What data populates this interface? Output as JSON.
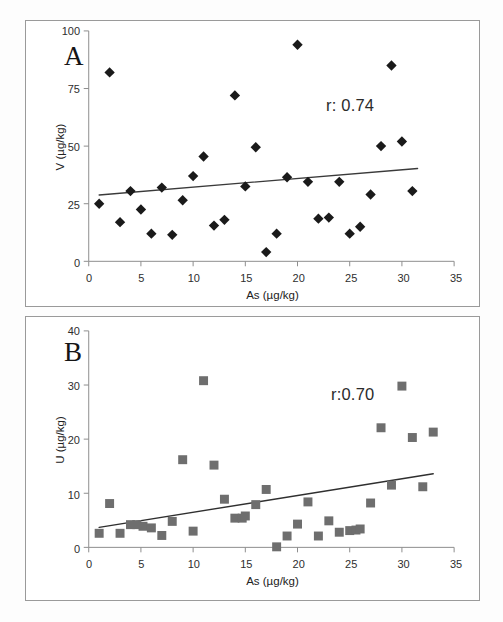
{
  "figure": {
    "caption": "",
    "background": "#fdfdfd",
    "panel_border_color": "#9a9a9a"
  },
  "chart_data": [
    {
      "type": "scatter",
      "panel": "A",
      "panel_label": "A",
      "title": "",
      "xlabel": "As (µg/kg)",
      "ylabel": "V (µg/kg)",
      "xlim": [
        0,
        35
      ],
      "ylim": [
        0,
        100
      ],
      "xticks": [
        0,
        5,
        10,
        15,
        20,
        25,
        30,
        35
      ],
      "yticks": [
        0,
        25,
        50,
        75,
        100
      ],
      "grid": false,
      "legend": "none",
      "annotation": "r: 0.74",
      "correlation_r": 0.74,
      "marker": "diamond",
      "marker_color": "#1a1a1a",
      "marker_size": 9,
      "trendline": {
        "color": "#3a3a3a",
        "width": 1.4,
        "x_start": 1.0,
        "y_start": 28.8,
        "x_end": 31.5,
        "y_end": 40.3
      },
      "points": [
        {
          "x": 1,
          "y": 25
        },
        {
          "x": 2,
          "y": 82
        },
        {
          "x": 3,
          "y": 17
        },
        {
          "x": 4,
          "y": 30.5
        },
        {
          "x": 5,
          "y": 22.5
        },
        {
          "x": 6,
          "y": 12
        },
        {
          "x": 7,
          "y": 32
        },
        {
          "x": 8,
          "y": 11.5
        },
        {
          "x": 9,
          "y": 26.5
        },
        {
          "x": 10,
          "y": 37
        },
        {
          "x": 11,
          "y": 45.5
        },
        {
          "x": 12,
          "y": 15.5
        },
        {
          "x": 13,
          "y": 18
        },
        {
          "x": 14,
          "y": 72
        },
        {
          "x": 15,
          "y": 32.5
        },
        {
          "x": 16,
          "y": 49.5
        },
        {
          "x": 17,
          "y": 4
        },
        {
          "x": 18,
          "y": 12
        },
        {
          "x": 19,
          "y": 36.5
        },
        {
          "x": 20,
          "y": 94
        },
        {
          "x": 21,
          "y": 34.5
        },
        {
          "x": 22,
          "y": 18.5
        },
        {
          "x": 23,
          "y": 19
        },
        {
          "x": 24,
          "y": 34.5
        },
        {
          "x": 25,
          "y": 12
        },
        {
          "x": 26,
          "y": 15
        },
        {
          "x": 27,
          "y": 29
        },
        {
          "x": 28,
          "y": 50
        },
        {
          "x": 29,
          "y": 85
        },
        {
          "x": 30,
          "y": 52
        },
        {
          "x": 31,
          "y": 30.5
        }
      ]
    },
    {
      "type": "scatter",
      "panel": "B",
      "panel_label": "B",
      "title": "",
      "xlabel": "As (µg/kg)",
      "ylabel": "U (µg/kg)",
      "xlim": [
        0,
        35
      ],
      "ylim": [
        0,
        40
      ],
      "xticks": [
        0,
        5,
        10,
        15,
        20,
        25,
        30,
        35
      ],
      "yticks": [
        0,
        10,
        20,
        30,
        40
      ],
      "grid": false,
      "legend": "none",
      "annotation": "r:0.70",
      "correlation_r": 0.7,
      "marker": "square",
      "marker_color": "#6e6e6e",
      "marker_size": 9,
      "trendline": {
        "color": "#2f2f2f",
        "width": 1.4,
        "x_start": 1.0,
        "y_start": 3.7,
        "x_end": 33.0,
        "y_end": 13.6
      },
      "points": [
        {
          "x": 1,
          "y": 2.6
        },
        {
          "x": 2,
          "y": 8.1
        },
        {
          "x": 3,
          "y": 2.6
        },
        {
          "x": 4,
          "y": 4.2
        },
        {
          "x": 4.6,
          "y": 4.2
        },
        {
          "x": 5.2,
          "y": 3.9
        },
        {
          "x": 6,
          "y": 3.6
        },
        {
          "x": 7,
          "y": 2.2
        },
        {
          "x": 8,
          "y": 4.8
        },
        {
          "x": 9,
          "y": 16.2
        },
        {
          "x": 10,
          "y": 3.0
        },
        {
          "x": 11,
          "y": 30.8
        },
        {
          "x": 12,
          "y": 15.2
        },
        {
          "x": 13,
          "y": 8.9
        },
        {
          "x": 14,
          "y": 5.4
        },
        {
          "x": 14.7,
          "y": 5.4
        },
        {
          "x": 15,
          "y": 5.8
        },
        {
          "x": 16,
          "y": 7.9
        },
        {
          "x": 17,
          "y": 10.7
        },
        {
          "x": 18,
          "y": 0.1
        },
        {
          "x": 19,
          "y": 2.1
        },
        {
          "x": 20,
          "y": 4.3
        },
        {
          "x": 21,
          "y": 8.4
        },
        {
          "x": 22,
          "y": 2.1
        },
        {
          "x": 23,
          "y": 4.9
        },
        {
          "x": 24,
          "y": 2.8
        },
        {
          "x": 25,
          "y": 3.1
        },
        {
          "x": 25.6,
          "y": 3.2
        },
        {
          "x": 26,
          "y": 3.4
        },
        {
          "x": 27,
          "y": 8.2
        },
        {
          "x": 28,
          "y": 22.1
        },
        {
          "x": 29,
          "y": 11.5
        },
        {
          "x": 30,
          "y": 29.8
        },
        {
          "x": 31,
          "y": 20.3
        },
        {
          "x": 32,
          "y": 11.2
        },
        {
          "x": 33,
          "y": 21.3
        }
      ]
    }
  ]
}
